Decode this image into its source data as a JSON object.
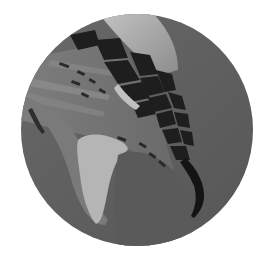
{
  "image": {
    "subject": "bird talon with scaled toe and curved claw",
    "style": "grayscale, circular crop",
    "shape": "circle",
    "circle": {
      "cx": 137,
      "cy": 130,
      "r": 116
    },
    "colors": {
      "background": "#ffffff",
      "base_gray": "#5a5a5a",
      "mid_gray": "#6e6e6e",
      "light_gray": "#a8a8a8",
      "highlight": "#bdbdbd",
      "scale_dark": "#1e1e1e",
      "claw": "#141414"
    }
  }
}
